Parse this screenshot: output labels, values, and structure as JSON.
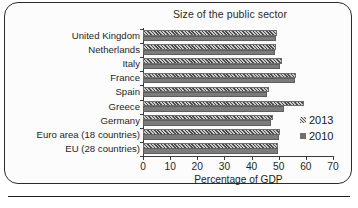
{
  "chart_data": {
    "type": "bar",
    "orientation": "horizontal",
    "title": "Size of the public sector",
    "xlabel": "Percentage of GDP",
    "ylabel": "",
    "xlim": [
      0,
      70
    ],
    "xticks": [
      0,
      10,
      20,
      30,
      40,
      50,
      60,
      70
    ],
    "grid": false,
    "legend_position": "right",
    "categories": [
      "United Kingdom",
      "Netherlands",
      "Italy",
      "France",
      "Spain",
      "Greece",
      "Germany",
      "Euro area (18 countries)",
      "EU (28 countries)"
    ],
    "series": [
      {
        "name": "2013",
        "marker": "hatched",
        "values": [
          49.2,
          48.9,
          51.3,
          56.3,
          46.4,
          59.3,
          47.9,
          50.3,
          49.7
        ]
      },
      {
        "name": "2010",
        "marker": "solid",
        "values": [
          49.0,
          48.7,
          50.6,
          56.1,
          45.6,
          51.9,
          47.3,
          50.1,
          49.7
        ]
      }
    ]
  },
  "legend": {
    "items": [
      {
        "label": "2013",
        "style": "hatch"
      },
      {
        "label": "2010",
        "style": "solid"
      }
    ]
  },
  "colors": {
    "bar_2013_hatch_dark": "#4a4a4a",
    "bar_2013_hatch_light": "#c9c9c9",
    "bar_2010_fill": "#7b7b7b",
    "axis": "#3a3a3a",
    "frame": "#2b2b2b",
    "text": "#1a1a1a",
    "background": "#fcfcfc"
  }
}
